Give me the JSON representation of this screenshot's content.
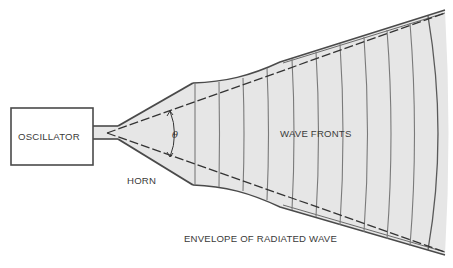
{
  "diagram": {
    "colors": {
      "stroke": "#4a4a4a",
      "fill": "#e6e6e6",
      "wavefront": "#7a7a7a",
      "text": "#3a3a3a"
    },
    "labels": {
      "oscillator": "OSCILLATOR",
      "horn": "HORN",
      "theta": "θ",
      "wave_fronts": "WAVE FRONTS",
      "envelope": "ENVELOPE OF RADIATED WAVE"
    },
    "wavefront_count": 11
  }
}
